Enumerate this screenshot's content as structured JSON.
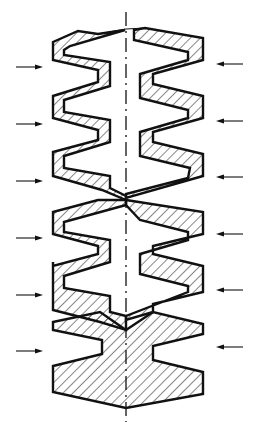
{
  "figure": {
    "type": "technical cross-section drawing",
    "colors": {
      "line": "#111111",
      "background": "#ffffff"
    },
    "centerline": {
      "x": 126,
      "y_top": 12,
      "y_bottom": 422,
      "style": "dash-dot"
    },
    "corrugations": 6,
    "arrows": {
      "left": [
        {
          "y": 67,
          "direction": "right"
        },
        {
          "y": 124,
          "direction": "right"
        },
        {
          "y": 181,
          "direction": "right"
        },
        {
          "y": 238,
          "direction": "right"
        },
        {
          "y": 295,
          "direction": "right"
        },
        {
          "y": 351,
          "direction": "right"
        }
      ],
      "right": [
        {
          "y": 64,
          "direction": "left"
        },
        {
          "y": 121,
          "direction": "left"
        },
        {
          "y": 177,
          "direction": "left"
        },
        {
          "y": 234,
          "direction": "left"
        },
        {
          "y": 290,
          "direction": "left"
        },
        {
          "y": 347,
          "direction": "left"
        }
      ]
    },
    "labels": []
  }
}
